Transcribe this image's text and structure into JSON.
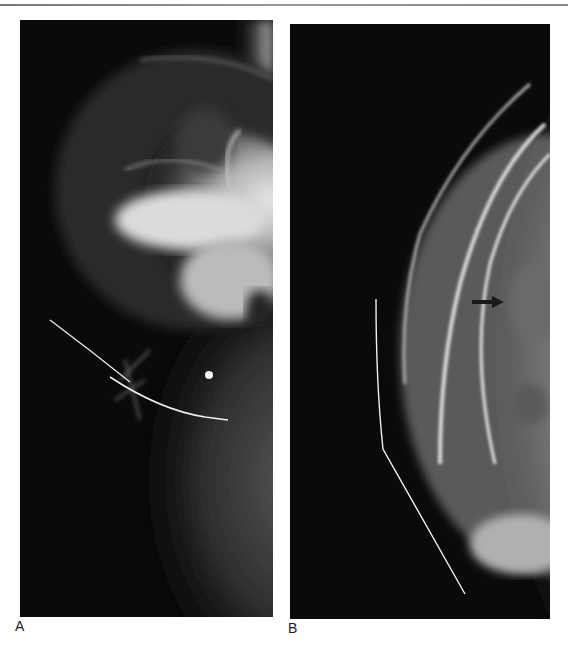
{
  "figure": {
    "header_fragment": "· · ·",
    "panels": [
      {
        "label": "A",
        "description": "Mammogram with localization wire (curved hookwire) and round marker dot",
        "annotations": [
          "localization-wire",
          "marker-dot"
        ]
      },
      {
        "label": "B",
        "description": "Mammogram with localization wire along breast contour and black arrow pointing right",
        "annotations": [
          "localization-wire",
          "arrow"
        ]
      }
    ],
    "colors": {
      "background": "#ffffff",
      "film_dark": "#0a0a0a",
      "tissue_light": "#d8d8d8",
      "wire": "#f0f0f0",
      "arrow": "#1a1a1a"
    }
  }
}
